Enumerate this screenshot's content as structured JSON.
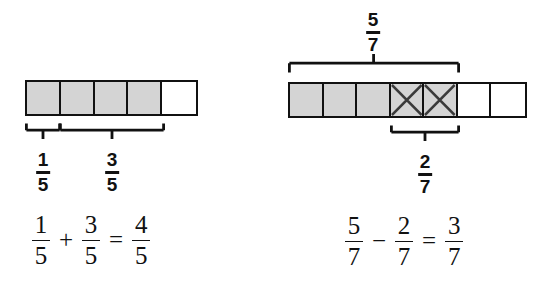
{
  "figure": {
    "title_text": "",
    "colors": {
      "ink": "#111111",
      "shade": "#d4d4d4",
      "background": "#ffffff"
    }
  },
  "left_model": {
    "name": "addition-fraction-bar-model",
    "total_cells": 5,
    "shaded_cells": 4,
    "denominator": "5",
    "cells": [
      {
        "shaded": true,
        "crossed": false
      },
      {
        "shaded": true,
        "crossed": false
      },
      {
        "shaded": true,
        "crossed": false
      },
      {
        "shaded": true,
        "crossed": false
      },
      {
        "shaded": false,
        "crossed": false
      }
    ],
    "brackets": [
      {
        "label_num": "1",
        "label_den": "5",
        "span_start": 0,
        "span_end": 1
      },
      {
        "label_num": "3",
        "label_den": "5",
        "span_start": 1,
        "span_end": 4
      }
    ],
    "equation": {
      "a_num": "1",
      "a_den": "5",
      "operator": "+",
      "b_num": "3",
      "b_den": "5",
      "equals": "=",
      "result_num": "4",
      "result_den": "5"
    }
  },
  "right_model": {
    "name": "subtraction-fraction-bar-model",
    "total_cells": 7,
    "shaded_cells": 5,
    "crossed_cells": 2,
    "denominator": "7",
    "cells": [
      {
        "shaded": true,
        "crossed": false
      },
      {
        "shaded": true,
        "crossed": false
      },
      {
        "shaded": true,
        "crossed": false
      },
      {
        "shaded": true,
        "crossed": true
      },
      {
        "shaded": true,
        "crossed": true
      },
      {
        "shaded": false,
        "crossed": false
      },
      {
        "shaded": false,
        "crossed": false
      }
    ],
    "top_bracket": {
      "label_num": "5",
      "label_den": "7",
      "span_start": 0,
      "span_end": 5
    },
    "bottom_bracket": {
      "label_num": "2",
      "label_den": "7",
      "span_start": 3,
      "span_end": 5
    },
    "equation": {
      "a_num": "5",
      "a_den": "7",
      "operator": "−",
      "b_num": "2",
      "b_den": "7",
      "equals": "=",
      "result_num": "3",
      "result_den": "7"
    }
  }
}
